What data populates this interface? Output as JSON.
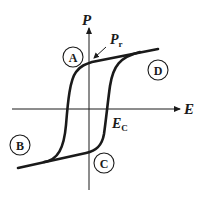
{
  "diagram": {
    "axes": {
      "vertical_label": "P",
      "horizontal_label": "E"
    },
    "annotations": {
      "remanent_polarization": {
        "main": "P",
        "sub": "r"
      },
      "coercive_field": {
        "main": "E",
        "sub": "C"
      }
    },
    "regions": [
      {
        "id": "A",
        "label": "A"
      },
      {
        "id": "B",
        "label": "B"
      },
      {
        "id": "C",
        "label": "C"
      },
      {
        "id": "D",
        "label": "D"
      }
    ],
    "colors": {
      "line": "#1a1a1a",
      "background": "#ffffff"
    }
  }
}
